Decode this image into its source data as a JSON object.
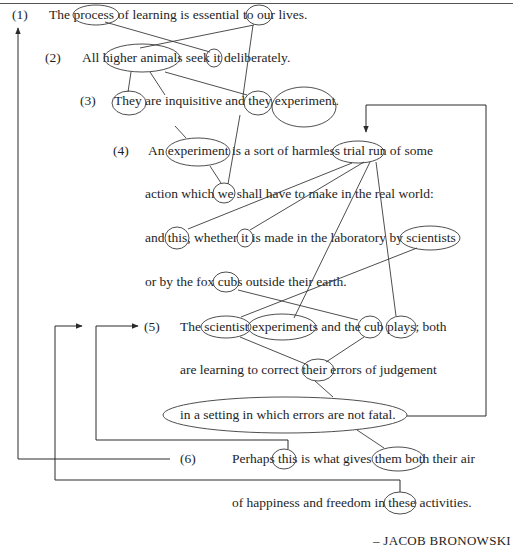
{
  "diagram": {
    "type": "text-cohesion-diagram",
    "sentences": [
      {
        "num": "(1)",
        "lines": [
          "The process of learning is essential to our lives."
        ]
      },
      {
        "num": "(2)",
        "lines": [
          "All higher animals seek it deliberately."
        ]
      },
      {
        "num": "(3)",
        "lines": [
          "They are inquisitive and they experiment."
        ]
      },
      {
        "num": "(4)",
        "lines": [
          "An experiment is a sort of harmless trial run of some",
          "action which we shall have to make in the real world:",
          "and this, whether it is made in the laboratory by scientists",
          "or by the fox cubs outside their earth."
        ]
      },
      {
        "num": "(5)",
        "lines": [
          "The scientist experiments and the cub plays; both",
          "are learning to correct their errors of judgement",
          "in a setting in which errors are not fatal."
        ]
      },
      {
        "num": "(6)",
        "lines": [
          "Perhaps this is what gives them both their air",
          "of happiness and freedom in these activities."
        ]
      }
    ],
    "circled_terms": [
      "process",
      "our",
      "higher animals",
      "it",
      "They",
      "they",
      "experiment.",
      "experiment",
      "trial run",
      "we",
      "this,",
      "it",
      "scientists",
      "cubs",
      "scientist",
      "experiments",
      "cub",
      "plays;",
      "their",
      "in a setting in which errors are not fatal.",
      "this",
      "them both",
      "these"
    ],
    "links": [
      [
        "process",
        "it"
      ],
      [
        "our",
        "higher animals"
      ],
      [
        "our",
        "they"
      ],
      [
        "higher animals",
        "They"
      ],
      [
        "higher animals",
        "experiment (4)"
      ],
      [
        "higher animals",
        "they"
      ],
      [
        "experiment (4)",
        "we"
      ],
      [
        "they",
        "we"
      ],
      [
        "trial run",
        "this,"
      ],
      [
        "trial run",
        "it"
      ],
      [
        "trial run",
        "experiments"
      ],
      [
        "trial run",
        "plays;"
      ],
      [
        "scientists",
        "scientist"
      ],
      [
        "cubs",
        "cub"
      ],
      [
        "scientist",
        "their"
      ],
      [
        "cub",
        "their"
      ],
      [
        "their",
        "in a setting..."
      ],
      [
        "in a setting...",
        "them both"
      ],
      [
        "in a setting...",
        "trial run"
      ],
      [
        "(1)",
        "(6)"
      ],
      [
        "(5)",
        "these"
      ],
      [
        "(5)",
        "this"
      ]
    ],
    "attribution": "– JACOB BRONOWSKI",
    "line_color": "#3a3a3a"
  }
}
